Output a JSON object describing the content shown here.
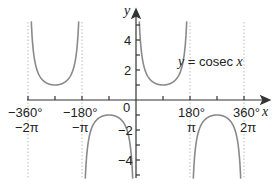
{
  "chart_data": {
    "type": "line",
    "title": "",
    "function": "y = cosec x",
    "curve_label": "y = cosec x",
    "xlabel": "x",
    "ylabel": "y",
    "xlim": [
      -400,
      400
    ],
    "ylim": [
      -5.5,
      5.5
    ],
    "x_ticks_deg": [
      -360,
      -270,
      -180,
      -90,
      0,
      90,
      180,
      270,
      360
    ],
    "x_tick_labels": [
      {
        "value": -360,
        "deg": "−360°",
        "rad": "−2π"
      },
      {
        "value": -180,
        "deg": "−180°",
        "rad": "−π"
      },
      {
        "value": 0,
        "deg": "0",
        "rad": ""
      },
      {
        "value": 180,
        "deg": "180°",
        "rad": "π"
      },
      {
        "value": 360,
        "deg": "360°",
        "rad": "2π"
      }
    ],
    "y_ticks": [
      -4,
      -2,
      2,
      4
    ],
    "y_tick_labels": [
      "4",
      "2",
      "−2",
      "−4"
    ],
    "asymptotes_deg": [
      -360,
      -180,
      180,
      360
    ],
    "branches": [
      {
        "interval": [
          -360,
          -180
        ],
        "direction": "up",
        "extremum": {
          "x": -270,
          "y": 1
        }
      },
      {
        "interval": [
          -180,
          0
        ],
        "direction": "down",
        "extremum": {
          "x": -90,
          "y": -1
        }
      },
      {
        "interval": [
          0,
          180
        ],
        "direction": "up",
        "extremum": {
          "x": 90,
          "y": 1
        }
      },
      {
        "interval": [
          180,
          360
        ],
        "direction": "down",
        "extremum": {
          "x": 270,
          "y": -1
        }
      }
    ],
    "grid": false,
    "colors": {
      "curve": "#8a8a8a",
      "axes": "#333333",
      "asymptote": "#bbbbbb"
    }
  },
  "labels": {
    "y_axis": "y",
    "x_axis": "x",
    "origin": "0",
    "curve": "y = cosec x",
    "y4": "4",
    "y2": "2",
    "yn2": "−2",
    "yn4": "−4",
    "xn360": "−360°",
    "xn360r": "−2π",
    "xn180": "−180°",
    "xn180r": "−π",
    "x180": "180°",
    "x180r": "π",
    "x360": "360°",
    "x360r": "2π"
  }
}
